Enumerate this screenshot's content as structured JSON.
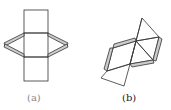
{
  "figure": {
    "panels": [
      {
        "id": "a",
        "label": "(a)",
        "description": "net of three stacked squares with gray chevron flaps on left and right"
      },
      {
        "id": "b",
        "label": "(b)",
        "description": "net of squares and triangles with gray flaps"
      }
    ],
    "colors": {
      "stroke": "#333333",
      "flap_fill": "#cccccc",
      "background": "#ffffff"
    }
  }
}
